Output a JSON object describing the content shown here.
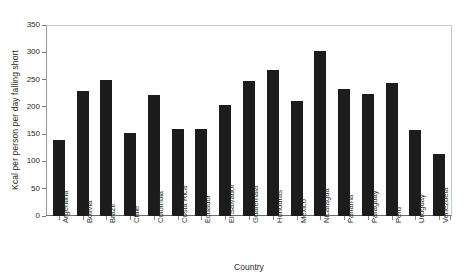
{
  "chart_data": {
    "type": "bar",
    "title": "",
    "xlabel": "Country",
    "ylabel": "Kcal per person per day falling short",
    "ylim": [
      0,
      350
    ],
    "yticks": [
      0,
      50,
      100,
      150,
      200,
      250,
      300,
      350
    ],
    "grid": false,
    "legend": null,
    "bar_color": "#1c1c1c",
    "categories": [
      "Argentina",
      "Bolivia",
      "Brazil",
      "Chile",
      "Colombia",
      "Costa Rica",
      "Ecuador",
      "El Salvador",
      "Guatemala",
      "Honduras",
      "Mexico",
      "Nicaragua",
      "Panama",
      "Paraguay",
      "Peru",
      "Uruguay",
      "Venezuela"
    ],
    "values": [
      140,
      229,
      249,
      152,
      222,
      160,
      160,
      203,
      248,
      268,
      211,
      303,
      232,
      224,
      243,
      157,
      114
    ]
  }
}
